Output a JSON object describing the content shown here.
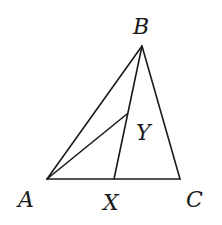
{
  "diagram": {
    "type": "triangle",
    "stroke_color": "#1a1a1a",
    "points": {
      "A": {
        "x": 47,
        "y": 179
      },
      "B": {
        "x": 142,
        "y": 46
      },
      "C": {
        "x": 180,
        "y": 179
      },
      "X": {
        "x": 114,
        "y": 179
      },
      "Y": {
        "x": 127,
        "y": 114
      }
    },
    "segments": [
      [
        "A",
        "B"
      ],
      [
        "B",
        "C"
      ],
      [
        "A",
        "C"
      ],
      [
        "B",
        "X"
      ],
      [
        "A",
        "Y"
      ]
    ],
    "labels": {
      "A": "A",
      "B": "B",
      "C": "C",
      "X": "X",
      "Y": "Y"
    }
  }
}
